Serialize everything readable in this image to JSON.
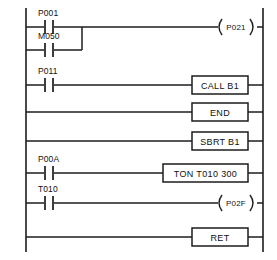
{
  "diagram": {
    "type": "ladder-logic",
    "line_color": "#1c1c1c",
    "background_color": "#ffffff",
    "rung_count": 7
  },
  "rungs": [
    {
      "index": 1,
      "contacts": [
        {
          "label": "P001",
          "type": "normally-open",
          "branch": "main"
        },
        {
          "label": "M050",
          "type": "normally-open",
          "branch": "parallel"
        }
      ],
      "output": {
        "kind": "coil",
        "label": "P021"
      }
    },
    {
      "index": 2,
      "contacts": [
        {
          "label": "P011",
          "type": "normally-open",
          "branch": "main"
        }
      ],
      "output": {
        "kind": "box",
        "label": "CALL  B1"
      }
    },
    {
      "index": 3,
      "contacts": [],
      "output": {
        "kind": "box",
        "label": "END"
      }
    },
    {
      "index": 4,
      "contacts": [],
      "output": {
        "kind": "box",
        "label": "SBRT  B1"
      }
    },
    {
      "index": 5,
      "contacts": [
        {
          "label": "P00A",
          "type": "normally-open",
          "branch": "main"
        }
      ],
      "output": {
        "kind": "box",
        "label": "TON  T010  300"
      }
    },
    {
      "index": 6,
      "contacts": [
        {
          "label": "T010",
          "type": "normally-open",
          "branch": "main"
        }
      ],
      "output": {
        "kind": "coil",
        "label": "P02F"
      }
    },
    {
      "index": 7,
      "contacts": [],
      "output": {
        "kind": "box",
        "label": "RET"
      }
    }
  ],
  "labels": {
    "contact_p001": "P001",
    "contact_m050": "M050",
    "contact_p011": "P011",
    "contact_p00a": "P00A",
    "contact_t010": "T010",
    "coil_p021": "P021",
    "coil_p02f": "P02F",
    "box_call_b1": "CALL  B1",
    "box_end": "END",
    "box_sbrt_b1": "SBRT  B1",
    "box_ton": "TON  T010  300",
    "box_ret": "RET"
  }
}
